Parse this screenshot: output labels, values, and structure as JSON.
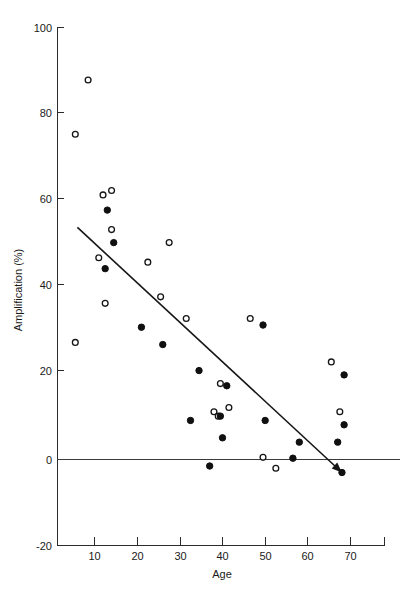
{
  "figure": {
    "background": "#ffffff",
    "ink_color": "#101010"
  },
  "chart_data": {
    "type": "scatter",
    "title": "",
    "xlabel": "Age",
    "ylabel": "Amplification (%)",
    "xlim": [
      0,
      77
    ],
    "ylim": [
      -20,
      100
    ],
    "xticks": [
      10,
      20,
      30,
      40,
      50,
      60,
      70
    ],
    "xtick_labels": [
      "10",
      "20",
      "30",
      "40",
      "50",
      "60",
      "70"
    ],
    "yticks": [
      -20,
      0,
      20,
      40,
      60,
      80,
      100
    ],
    "ytick_labels": [
      "-20",
      "0",
      "20",
      "40",
      "60",
      "80",
      "100"
    ],
    "grid": false,
    "legend_position": "none",
    "reference_lines": [
      {
        "name": "zero-line",
        "orientation": "horizontal",
        "value": 0
      }
    ],
    "trend_line": {
      "name": "regression-line",
      "x_start": 6,
      "y_start": 53.5,
      "x_end": 68,
      "y_end": -3,
      "arrow_end": true
    },
    "series": [
      {
        "name": "open-circles",
        "marker": "open-circle",
        "points": [
          {
            "x": 8.5,
            "y": 87.5
          },
          {
            "x": 5.5,
            "y": 75.0
          },
          {
            "x": 12.0,
            "y": 61.0
          },
          {
            "x": 14.0,
            "y": 62.0
          },
          {
            "x": 14.0,
            "y": 53.0
          },
          {
            "x": 11.0,
            "y": 46.5
          },
          {
            "x": 27.5,
            "y": 50.0
          },
          {
            "x": 22.5,
            "y": 45.5
          },
          {
            "x": 25.5,
            "y": 37.5
          },
          {
            "x": 12.5,
            "y": 36.0
          },
          {
            "x": 31.5,
            "y": 32.5
          },
          {
            "x": 46.5,
            "y": 32.5
          },
          {
            "x": 5.5,
            "y": 27.0
          },
          {
            "x": 65.5,
            "y": 22.5
          },
          {
            "x": 39.5,
            "y": 17.5
          },
          {
            "x": 41.5,
            "y": 12.0
          },
          {
            "x": 38.0,
            "y": 11.0
          },
          {
            "x": 67.5,
            "y": 11.0
          },
          {
            "x": 39.0,
            "y": 10.0
          },
          {
            "x": 49.5,
            "y": 0.5
          },
          {
            "x": 52.5,
            "y": -2.0
          }
        ]
      },
      {
        "name": "closed-circles",
        "marker": "filled-circle",
        "points": [
          {
            "x": 13.0,
            "y": 57.5
          },
          {
            "x": 14.5,
            "y": 50.0
          },
          {
            "x": 12.5,
            "y": 44.0
          },
          {
            "x": 21.0,
            "y": 30.5
          },
          {
            "x": 49.5,
            "y": 31.0
          },
          {
            "x": 26.0,
            "y": 26.5
          },
          {
            "x": 34.5,
            "y": 20.5
          },
          {
            "x": 68.5,
            "y": 19.5
          },
          {
            "x": 41.0,
            "y": 17.0
          },
          {
            "x": 32.5,
            "y": 9.0
          },
          {
            "x": 39.5,
            "y": 10.0
          },
          {
            "x": 50.0,
            "y": 9.0
          },
          {
            "x": 68.5,
            "y": 8.0
          },
          {
            "x": 40.0,
            "y": 5.0
          },
          {
            "x": 58.0,
            "y": 4.0
          },
          {
            "x": 67.0,
            "y": 4.0
          },
          {
            "x": 56.5,
            "y": 0.3
          },
          {
            "x": 37.0,
            "y": -1.5
          },
          {
            "x": 68.0,
            "y": -3.0
          }
        ]
      }
    ]
  }
}
